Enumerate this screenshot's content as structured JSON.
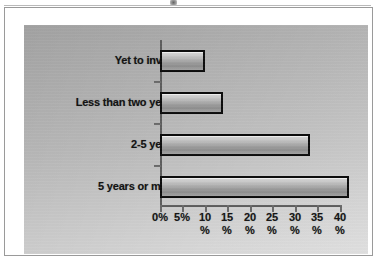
{
  "figure": {
    "artifact_name": "scan-smudge"
  },
  "chart_data": {
    "type": "bar",
    "orientation": "horizontal",
    "title": "",
    "subtitle": "",
    "xlabel": "",
    "ylabel": "",
    "categories": [
      "Yet to invest",
      "Less than two years",
      "2-5 years",
      "5 years or more"
    ],
    "values": [
      9,
      13,
      32.5,
      41
    ],
    "value_unit": "%",
    "xlim": [
      0,
      40
    ],
    "xticks": [
      0,
      5,
      10,
      15,
      20,
      25,
      30,
      35,
      40
    ],
    "xtick_labels": [
      "0%",
      "5%",
      "10 %",
      "15 %",
      "20 %",
      "25 %",
      "30 %",
      "35 %",
      "40 %"
    ],
    "xtick_label_lines": [
      [
        "0%",
        ""
      ],
      [
        "5%",
        ""
      ],
      [
        "10",
        "%"
      ],
      [
        "15",
        "%"
      ],
      [
        "20",
        "%"
      ],
      [
        "25",
        "%"
      ],
      [
        "30",
        "%"
      ],
      [
        "35",
        "%"
      ],
      [
        "40",
        "%"
      ]
    ],
    "grid": false,
    "legend": false,
    "legend_position": "none",
    "colors": {
      "bar_fill_light": "#d9d9d9",
      "bar_fill_dark": "#8f8f8f",
      "bar_outline": "#0d0d0d",
      "plot_background": "#c6c6c6",
      "axis": "#5d5d5d",
      "text": "#131313",
      "frame": "#9a9a9a",
      "page_background": "#ffffff"
    }
  }
}
